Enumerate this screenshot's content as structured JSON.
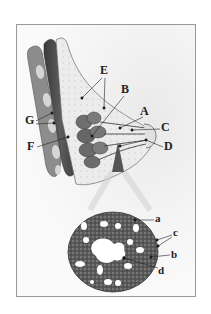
{
  "figure": {
    "upper_labels": [
      {
        "id": "A",
        "text": "A"
      },
      {
        "id": "B",
        "text": "B"
      },
      {
        "id": "C",
        "text": "C"
      },
      {
        "id": "D",
        "text": "D"
      },
      {
        "id": "E",
        "text": "E"
      },
      {
        "id": "F",
        "text": "F"
      },
      {
        "id": "G",
        "text": "G"
      }
    ],
    "lower_labels": [
      {
        "id": "a",
        "text": "a"
      },
      {
        "id": "b",
        "text": "b"
      },
      {
        "id": "c",
        "text": "c"
      },
      {
        "id": "d",
        "text": "d"
      }
    ],
    "colors": {
      "frame_border": "#9a9a9a",
      "muscle_dark": "#4a4a4a",
      "rib": "#8a8a8a",
      "gland": "#6e6e6e",
      "fat": "#e4e4e4",
      "ink": "#222222"
    }
  }
}
